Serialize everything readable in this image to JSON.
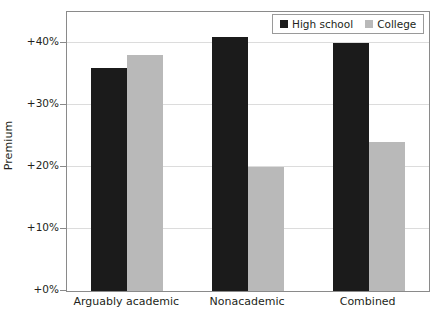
{
  "chart_data": {
    "type": "bar",
    "title": "",
    "subtitle": "",
    "xlabel": "",
    "ylabel": "Premium",
    "categories": [
      "Arguably academic",
      "Nonacademic",
      "Combined"
    ],
    "series": [
      {
        "name": "High school",
        "color": "#1b1b1b",
        "values": [
          36,
          41,
          40
        ]
      },
      {
        "name": "College",
        "color": "#b9b9b9",
        "values": [
          38,
          20,
          24
        ]
      }
    ],
    "ylim": [
      0,
      45
    ],
    "ytick_values": [
      0,
      10,
      20,
      30,
      40
    ],
    "ytick_labels": [
      "+0%",
      "+10%",
      "+20%",
      "+30%",
      "+40%"
    ],
    "grid": "horizontal",
    "legend_position": "top-right",
    "value_unit": "percent",
    "value_prefix": "+",
    "value_suffix": "%"
  },
  "legend": {
    "entries": [
      {
        "label": "High school",
        "swatch": "legend-swatch-high-school"
      },
      {
        "label": "College",
        "swatch": "legend-swatch-college"
      }
    ]
  },
  "axes": {
    "y_title": "Premium"
  }
}
